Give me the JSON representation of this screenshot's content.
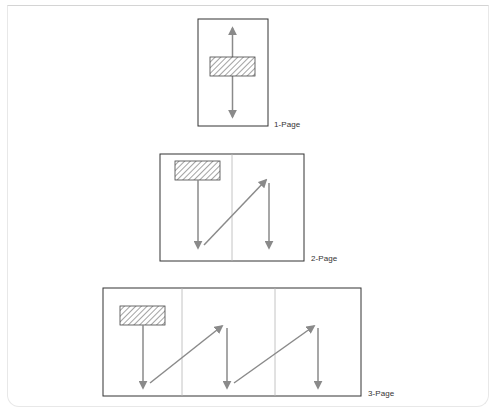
{
  "diagram": {
    "type": "page-scroll-flow",
    "colors": {
      "border": "#333333",
      "arrow": "#8a8a8a",
      "divider": "#b5b5b5",
      "hatch": "#555555"
    },
    "panels": [
      {
        "label": "1-Page",
        "pages": 1,
        "flow": "vertical bidirectional scroll from center block"
      },
      {
        "label": "2-Page",
        "pages": 2,
        "flow": "down, diagonal up to next page, down"
      },
      {
        "label": "3-Page",
        "pages": 3,
        "flow": "down, diagonal up, down, diagonal up, down"
      }
    ]
  }
}
